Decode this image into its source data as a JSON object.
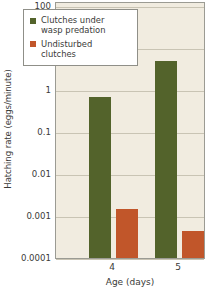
{
  "chart_data": {
    "type": "bar",
    "title": "",
    "xlabel": "Age (days)",
    "ylabel": "Hatching rate (eggs/minute)",
    "categories": [
      "4",
      "5"
    ],
    "yscale": "log",
    "ylim": [
      0.0001,
      100
    ],
    "ytick_labels": [
      "100",
      "10",
      "1",
      "0.1",
      "0.01",
      "0.001",
      "0.0001"
    ],
    "ytick_values": [
      100,
      10,
      1,
      0.1,
      0.01,
      0.001,
      0.0001
    ],
    "grid": true,
    "legend_position": "top-center",
    "series": [
      {
        "name": "Clutches under wasp predation",
        "color": "#53632b",
        "values": [
          0.7,
          5.0
        ]
      },
      {
        "name": "Undisturbed clutches",
        "color": "#c1562a",
        "values": [
          0.0015,
          0.00045
        ]
      }
    ]
  },
  "legend": {
    "entries": [
      {
        "label_line1": "Clutches under",
        "label_line2": "wasp predation"
      },
      {
        "label_line1": "Undisturbed",
        "label_line2": "clutches"
      }
    ]
  },
  "colors": {
    "green": "#53632b",
    "orange": "#c1562a",
    "plot_background": "#f1ece0",
    "gridline": "#c9c4b4",
    "axis_border": "#9b9b93",
    "text": "#3a3a38",
    "page_background": "#ffffff"
  }
}
